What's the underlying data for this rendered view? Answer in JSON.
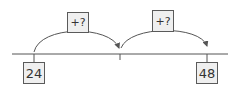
{
  "diagram": {
    "type": "number-line-jumps",
    "start_value": "24",
    "end_value": "48",
    "jumps": [
      {
        "label": "+?"
      },
      {
        "label": "+?"
      }
    ],
    "ticks": 3,
    "colors": {
      "line": "#555555",
      "box_fill": "#efefef",
      "box_border": "#5a5a5a",
      "text": "#333333"
    }
  }
}
